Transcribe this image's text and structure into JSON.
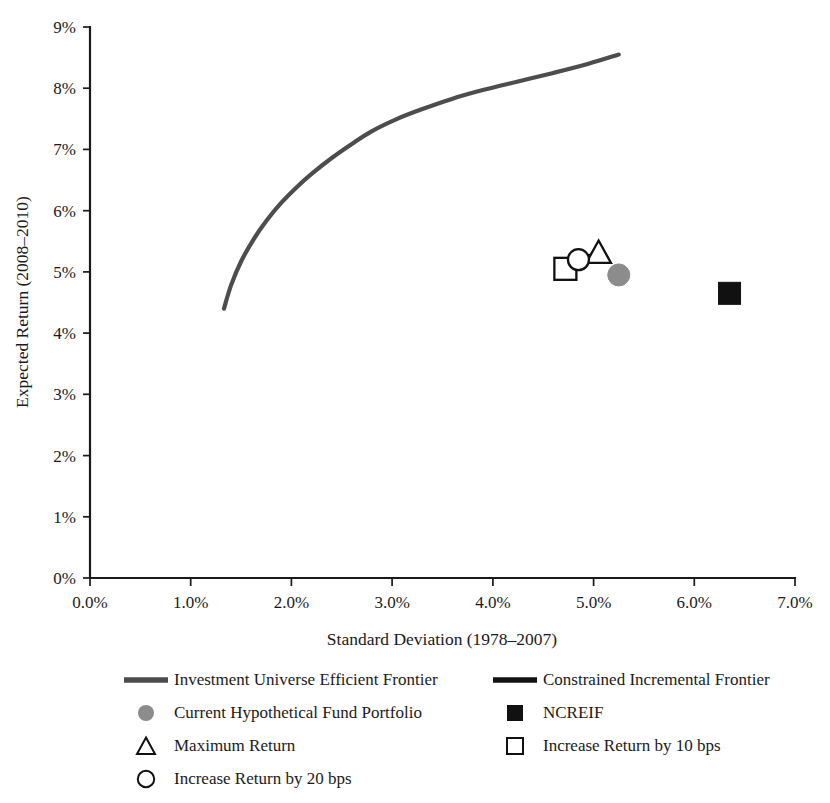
{
  "chart_data": {
    "type": "scatter",
    "title": "",
    "xlabel": "Standard Deviation (1978–2007)",
    "ylabel": "Expected Return (2008–2010)",
    "xlim": [
      0,
      7
    ],
    "ylim": [
      0,
      9
    ],
    "grid": false,
    "x_tick_labels": [
      "0.0%",
      "1.0%",
      "2.0%",
      "3.0%",
      "4.0%",
      "5.0%",
      "6.0%",
      "7.0%"
    ],
    "x_tick_values": [
      0,
      1,
      2,
      3,
      4,
      5,
      6,
      7
    ],
    "y_tick_labels": [
      "0%",
      "1%",
      "2%",
      "3%",
      "4%",
      "5%",
      "6%",
      "7%",
      "8%",
      "9%"
    ],
    "y_tick_values": [
      0,
      1,
      2,
      3,
      4,
      5,
      6,
      7,
      8,
      9
    ],
    "legend_position": "below",
    "series": [
      {
        "name": "Investment Universe Efficient Frontier",
        "type": "line",
        "color": "#4d4d4d",
        "marker": "line-gray",
        "points": [
          [
            1.33,
            4.4
          ],
          [
            1.4,
            4.78
          ],
          [
            1.5,
            5.17
          ],
          [
            1.62,
            5.52
          ],
          [
            1.75,
            5.83
          ],
          [
            1.9,
            6.13
          ],
          [
            2.05,
            6.38
          ],
          [
            2.2,
            6.6
          ],
          [
            2.4,
            6.86
          ],
          [
            2.6,
            7.09
          ],
          [
            2.8,
            7.3
          ],
          [
            3.05,
            7.5
          ],
          [
            3.3,
            7.66
          ],
          [
            3.6,
            7.83
          ],
          [
            3.9,
            7.97
          ],
          [
            4.25,
            8.11
          ],
          [
            4.6,
            8.25
          ],
          [
            4.95,
            8.4
          ],
          [
            5.25,
            8.55
          ]
        ]
      },
      {
        "name": "Constrained Incremental Frontier",
        "type": "line",
        "color": "#111111",
        "marker": "line-black",
        "points": [
          [
            4.85,
            5.2
          ],
          [
            5.05,
            5.3
          ]
        ]
      },
      {
        "name": "Current Hypothetical Fund Portfolio",
        "type": "point",
        "color": "#8c8c8c",
        "marker": "filled-circle",
        "points": [
          [
            5.25,
            4.95
          ]
        ]
      },
      {
        "name": "NCREIF",
        "type": "point",
        "color": "#111111",
        "marker": "filled-square",
        "points": [
          [
            6.35,
            4.65
          ]
        ]
      },
      {
        "name": "Maximum Return",
        "type": "point",
        "color": "#111111",
        "marker": "open-triangle",
        "points": [
          [
            5.05,
            5.3
          ]
        ]
      },
      {
        "name": "Increase Return by 10 bps",
        "type": "point",
        "color": "#111111",
        "marker": "open-square",
        "points": [
          [
            4.72,
            5.05
          ]
        ]
      },
      {
        "name": "Increase Return by 20 bps",
        "type": "point",
        "color": "#111111",
        "marker": "open-circle",
        "points": [
          [
            4.85,
            5.2
          ]
        ]
      }
    ]
  },
  "axes": {
    "x_title": "Standard Deviation (1978–2007)",
    "y_title": "Expected Return (2008–2010)",
    "x_ticks": [
      "0.0%",
      "1.0%",
      "2.0%",
      "3.0%",
      "4.0%",
      "5.0%",
      "6.0%",
      "7.0%"
    ],
    "y_ticks": [
      "0%",
      "1%",
      "2%",
      "3%",
      "4%",
      "5%",
      "6%",
      "7%",
      "8%",
      "9%"
    ]
  },
  "legend": {
    "left_column": [
      {
        "label": "Investment Universe Efficient Frontier",
        "symbol": "line-gray"
      },
      {
        "label": "Current Hypothetical Fund Portfolio",
        "symbol": "filled-circle-gray"
      },
      {
        "label": "Maximum Return",
        "symbol": "open-triangle"
      },
      {
        "label": "Increase Return by 20 bps",
        "symbol": "open-circle"
      }
    ],
    "right_column": [
      {
        "label": "Constrained Incremental Frontier",
        "symbol": "line-black"
      },
      {
        "label": "NCREIF",
        "symbol": "filled-square-black"
      },
      {
        "label": "Increase Return by 10 bps",
        "symbol": "open-square"
      }
    ]
  },
  "colors": {
    "frontier_gray": "#4d4d4d",
    "incremental_black": "#111111",
    "portfolio_gray": "#8c8c8c",
    "axis": "#1a1a1a",
    "background": "#ffffff"
  }
}
